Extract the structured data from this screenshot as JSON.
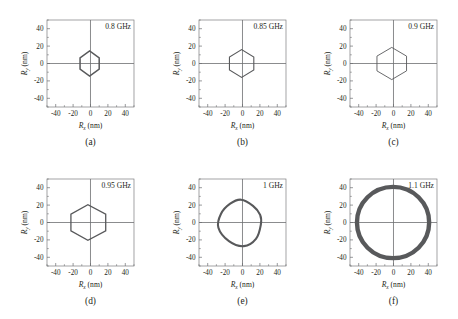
{
  "figure": {
    "axis_titles": {
      "x_symbol": "R",
      "x_sub": "x",
      "y_symbol": "R",
      "y_sub": "y",
      "unit": "(nm)"
    },
    "tick_labels_x": [
      "-40",
      "-20",
      "0",
      "20",
      "40"
    ],
    "tick_labels_y": [
      "-40",
      "-20",
      "0",
      "20",
      "40"
    ],
    "axis_range": [
      -50,
      50
    ],
    "tick_values": [
      -40,
      -20,
      0,
      20,
      40
    ],
    "colors": {
      "trace": "#58595b",
      "axis": "#6d6e71",
      "text": "#231f20",
      "background": "#ffffff"
    }
  },
  "chart_data": [
    {
      "type": "line",
      "panel": "(a)",
      "title": "0.8 GHz",
      "frequency_ghz": 0.8,
      "xlabel": "Rx (nm)",
      "ylabel": "Ry (nm)",
      "xlim": [
        -50,
        50
      ],
      "ylim": [
        -50,
        50
      ],
      "shape": "hexagon",
      "stroke_width": 1.5,
      "center": [
        -0.5,
        0.0
      ],
      "radius_x": 11.5,
      "radius_y": 14.5,
      "rotation_deg": 0,
      "vertices": [
        [
          10.5,
          6.5
        ],
        [
          10.5,
          -6.5
        ],
        [
          -0.5,
          -14.5
        ],
        [
          -11.5,
          -6.5
        ],
        [
          -11.5,
          6.5
        ],
        [
          -0.5,
          14.5
        ]
      ]
    },
    {
      "type": "line",
      "panel": "(b)",
      "title": "0.85 GHz",
      "frequency_ghz": 0.85,
      "xlabel": "Rx (nm)",
      "ylabel": "Ry (nm)",
      "xlim": [
        -50,
        50
      ],
      "ylim": [
        -50,
        50
      ],
      "shape": "hexagon",
      "stroke_width": 1.1,
      "center": [
        -0.5,
        0.0
      ],
      "radius_x": 14.0,
      "radius_y": 16.0,
      "rotation_deg": 0,
      "vertices": [
        [
          13.5,
          7.5
        ],
        [
          13.5,
          -7.5
        ],
        [
          -0.5,
          -16.0
        ],
        [
          -14.5,
          -7.5
        ],
        [
          -14.5,
          7.5
        ],
        [
          -0.5,
          16.0
        ]
      ]
    },
    {
      "type": "line",
      "panel": "(c)",
      "title": "0.9 GHz",
      "frequency_ghz": 0.9,
      "xlabel": "Rx (nm)",
      "ylabel": "Ry (nm)",
      "xlim": [
        -50,
        50
      ],
      "ylim": [
        -50,
        50
      ],
      "shape": "hexagon",
      "stroke_width": 0.9,
      "center": [
        -1.0,
        0.0
      ],
      "radius_x": 17.0,
      "radius_y": 18.5,
      "rotation_deg": 0,
      "vertices": [
        [
          16.0,
          8.5
        ],
        [
          16.0,
          -8.5
        ],
        [
          -1.0,
          -18.5
        ],
        [
          -18.0,
          -8.5
        ],
        [
          -18.0,
          8.5
        ],
        [
          -1.0,
          18.5
        ]
      ]
    },
    {
      "type": "line",
      "panel": "(d)",
      "title": "0.95 GHz",
      "frequency_ghz": 0.95,
      "xlabel": "Rx (nm)",
      "ylabel": "Ry (nm)",
      "xlim": [
        -50,
        50
      ],
      "ylim": [
        -50,
        50
      ],
      "shape": "hexagon",
      "stroke_width": 1.3,
      "center": [
        -1.5,
        0.0
      ],
      "radius_x": 20.0,
      "radius_y": 20.5,
      "rotation_deg": 0,
      "vertices": [
        [
          19.0,
          9.5
        ],
        [
          19.0,
          -9.5
        ],
        [
          -1.5,
          -20.5
        ],
        [
          -21.0,
          -9.5
        ],
        [
          -21.0,
          9.5
        ],
        [
          -1.5,
          20.5
        ]
      ]
    },
    {
      "type": "line",
      "panel": "(e)",
      "title": "1 GHz",
      "frequency_ghz": 1.0,
      "xlabel": "Rx (nm)",
      "ylabel": "Ry (nm)",
      "xlim": [
        -50,
        50
      ],
      "ylim": [
        -50,
        50
      ],
      "shape": "hexagon-wavy",
      "stroke_width": 2.1,
      "center": [
        -2.0,
        0.0
      ],
      "radius_x": 24.5,
      "radius_y": 25.5,
      "rotation_deg": -14,
      "vertices": [
        [
          23.0,
          3.0
        ],
        [
          21.5,
          -14.0
        ],
        [
          10.0,
          -25.5
        ],
        [
          -8.0,
          -24.0
        ],
        [
          -23.5,
          -12.0
        ],
        [
          -24.5,
          4.0
        ],
        [
          -17.0,
          18.0
        ],
        [
          -6.0,
          25.5
        ],
        [
          9.0,
          22.0
        ],
        [
          19.5,
          14.0
        ]
      ]
    },
    {
      "type": "line",
      "panel": "(f)",
      "title": "1.1 GHz",
      "frequency_ghz": 1.1,
      "xlabel": "Rx (nm)",
      "ylabel": "Ry (nm)",
      "xlim": [
        -50,
        50
      ],
      "ylim": [
        -50,
        50
      ],
      "shape": "circle",
      "stroke_width": 4.4,
      "center": [
        -0.5,
        0.0
      ],
      "radius_x": 41.5,
      "radius_y": 41.0,
      "rotation_deg": 0,
      "vertices": []
    }
  ]
}
